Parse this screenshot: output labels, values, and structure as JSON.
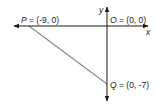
{
  "diagram": {
    "type": "coordinate-plane-right-triangle",
    "axes": {
      "x_label": "x",
      "y_label": "y",
      "color": "#1a1a1a"
    },
    "points": [
      {
        "id": "P",
        "name": "P",
        "coords_text": "(-9, 0)",
        "x": -9,
        "y": 0
      },
      {
        "id": "O",
        "name": "O",
        "coords_text": "(0, 0)",
        "x": 0,
        "y": 0
      },
      {
        "id": "Q",
        "name": "Q",
        "coords_text": "(0, -7)",
        "x": 0,
        "y": -7
      }
    ],
    "segments": [
      {
        "from": "P",
        "to": "Q",
        "color": "#8c8c8c"
      }
    ],
    "labels": {
      "P": {
        "letter": "P",
        "rest": " = (-9, 0)"
      },
      "O": {
        "letter": "O",
        "rest": " = (0, 0)"
      },
      "Q": {
        "letter": "Q",
        "rest": " = (0, -7)"
      }
    }
  }
}
